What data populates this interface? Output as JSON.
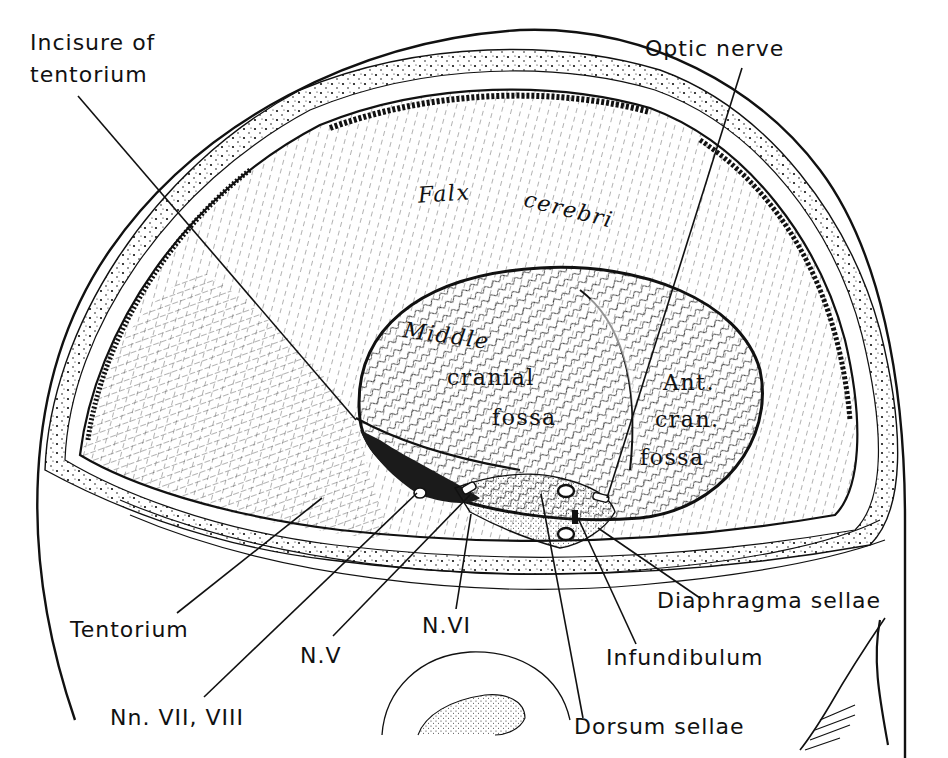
{
  "figure": {
    "colors": {
      "ink": "#111111",
      "paper": "#ffffff",
      "shade": "#2a2a2a"
    }
  },
  "labels": {
    "incisure_of_tentorium": {
      "line1": "Incisure of",
      "line2": "tentorium"
    },
    "optic_nerve": "Optic nerve",
    "falx_cerebri": {
      "word1": "Falx",
      "word2": "cerebri"
    },
    "middle_cranial_fossa": {
      "line1": "Middle",
      "line2": "cranial",
      "line3": "fossa"
    },
    "anterior_cranial_fossa": {
      "line1": "Ant.",
      "line2": "cran.",
      "line3": "fossa"
    },
    "tentorium": "Tentorium",
    "n_v": "N.V",
    "n_vi": "N.VI",
    "nn_vii_viii": "Nn. VII, VIII",
    "diaphragma_sellae": "Diaphragma sellae",
    "infundibulum": "Infundibulum",
    "dorsum_sellae": "Dorsum sellae"
  },
  "leader_lines": [
    {
      "name": "incisure-of-tentorium-leader",
      "x1": 78,
      "y1": 96,
      "x2": 356,
      "y2": 420
    },
    {
      "name": "optic-nerve-leader",
      "x1": 742,
      "y1": 68,
      "x2": 607,
      "y2": 498
    },
    {
      "name": "tentorium-leader",
      "x1": 177,
      "y1": 613,
      "x2": 322,
      "y2": 498
    },
    {
      "name": "nn-vii-viii-leader",
      "x1": 204,
      "y1": 697,
      "x2": 417,
      "y2": 493
    },
    {
      "name": "n-v-leader",
      "x1": 333,
      "y1": 636,
      "x2": 470,
      "y2": 495
    },
    {
      "name": "n-vi-leader",
      "x1": 456,
      "y1": 609,
      "x2": 471,
      "y2": 514
    },
    {
      "name": "dorsum-sellae-leader",
      "x1": 583,
      "y1": 718,
      "x2": 541,
      "y2": 494
    },
    {
      "name": "infundibulum-leader",
      "x1": 636,
      "y1": 644,
      "x2": 578,
      "y2": 518
    },
    {
      "name": "diaphragma-sellae-leader",
      "x1": 700,
      "y1": 598,
      "x2": 598,
      "y2": 528
    }
  ]
}
